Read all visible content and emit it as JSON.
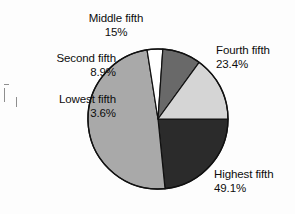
{
  "chart_data": {
    "type": "pie",
    "title": "",
    "subtitle": "",
    "xlabel": "",
    "ylabel": "",
    "legend_position": "callout-labels",
    "grid": false,
    "units": "percent",
    "start_angle_deg": 0,
    "direction": "clockwise",
    "categories": [
      "Fourth fifth",
      "Highest fifth",
      "Lowest fifth",
      "Second fifth",
      "Middle fifth"
    ],
    "values": [
      23.4,
      49.1,
      3.6,
      8.9,
      15.0
    ],
    "slices": [
      {
        "label": "Fourth fifth",
        "value": 23.4,
        "value_text": "23.4%",
        "color": "#2b2b2b",
        "start_deg": 0,
        "sweep_deg": 84.24
      },
      {
        "label": "Highest fifth",
        "value": 49.1,
        "value_text": "49.1%",
        "color": "#a9a9a9",
        "start_deg": 84.24,
        "sweep_deg": 176.76
      },
      {
        "label": "Lowest fifth",
        "value": 3.6,
        "value_text": "3.6%",
        "color": "#ffffff",
        "start_deg": 261.0,
        "sweep_deg": 12.96
      },
      {
        "label": "Second fifth",
        "value": 8.9,
        "value_text": "8.9%",
        "color": "#696969",
        "start_deg": 273.96,
        "sweep_deg": 32.04
      },
      {
        "label": "Middle fifth",
        "value": 15.0,
        "value_text": "15%",
        "color": "#d5d5d5",
        "start_deg": 306.0,
        "sweep_deg": 54.0
      }
    ],
    "total": 100.0
  },
  "labels": {
    "middle": {
      "name": "Middle fifth",
      "pct": "15%"
    },
    "fourth": {
      "name": "Fourth fifth",
      "pct": "23.4%"
    },
    "second": {
      "name": "Second fifth",
      "pct": "8.9%"
    },
    "lowest": {
      "name": "Lowest fifth",
      "pct": "3.6%"
    },
    "highest": {
      "name": "Highest fifth",
      "pct": "49.1%"
    }
  },
  "geometry": {
    "center_x": 158,
    "center_y": 119,
    "radius": 70
  },
  "colors": {
    "background": "#fdfdfd",
    "outline": "#111111",
    "text": "#0d0d0d"
  }
}
